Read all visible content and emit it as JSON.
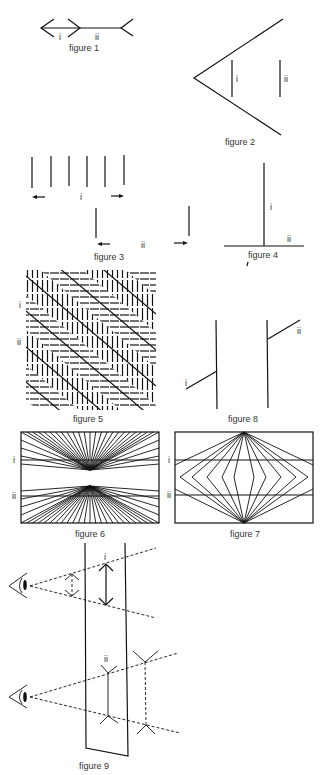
{
  "figures": [
    {
      "id": "figure-1",
      "caption": "figure 1",
      "labels": [
        "i",
        "ii"
      ]
    },
    {
      "id": "figure-2",
      "caption": "figure 2",
      "labels": [
        "i",
        "ii"
      ]
    },
    {
      "id": "figure-3",
      "caption": "figure 3",
      "labels": [
        "i",
        "ii"
      ]
    },
    {
      "id": "figure-4",
      "caption": "figure 4",
      "labels": [
        "i",
        "ii"
      ]
    },
    {
      "id": "figure-5",
      "caption": "figure 5",
      "labels": [
        "i",
        "ii"
      ]
    },
    {
      "id": "figure-6",
      "caption": "figure 6",
      "labels": [
        "i",
        "ii"
      ]
    },
    {
      "id": "figure-7",
      "caption": "figure 7",
      "labels": [
        "i",
        "ii"
      ]
    },
    {
      "id": "figure-8",
      "caption": "figure 8",
      "labels": [
        "i",
        "ii"
      ]
    },
    {
      "id": "figure-9",
      "caption": "figure 9",
      "labels": [
        "i",
        "ii"
      ]
    }
  ],
  "colors": {
    "ink": "#111111",
    "background": "#ffffff"
  }
}
